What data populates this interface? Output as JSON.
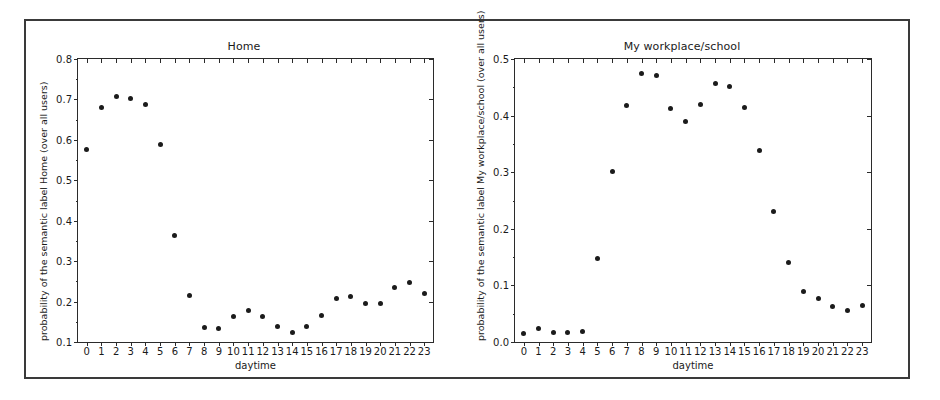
{
  "page": {
    "background_color": "#ffffff",
    "frame_color": "#3a3a3a",
    "marker_color": "#1b1b1b",
    "axis_color": "#2b2b2b"
  },
  "charts": [
    {
      "id": "home",
      "title": "Home",
      "xlabel": "daytime",
      "ylabel": "probability of the semantic label Home (over all users)",
      "xticks": [
        "0",
        "1",
        "2",
        "3",
        "4",
        "5",
        "6",
        "7",
        "8",
        "9",
        "10",
        "11",
        "12",
        "13",
        "14",
        "15",
        "16",
        "17",
        "18",
        "19",
        "20",
        "21",
        "22",
        "23"
      ],
      "yticks": [
        "0.1",
        "0.2",
        "0.3",
        "0.4",
        "0.5",
        "0.6",
        "0.7",
        "0.8"
      ]
    },
    {
      "id": "work",
      "title": "My workplace/school",
      "xlabel": "daytime",
      "ylabel": "probability of the semantic label My workplace/school (over all users)",
      "xticks": [
        "0",
        "1",
        "2",
        "3",
        "4",
        "5",
        "6",
        "7",
        "8",
        "9",
        "10",
        "11",
        "12",
        "13",
        "14",
        "15",
        "16",
        "17",
        "18",
        "19",
        "20",
        "21",
        "22",
        "23"
      ],
      "yticks": [
        "0.0",
        "0.1",
        "0.2",
        "0.3",
        "0.4",
        "0.5"
      ]
    }
  ],
  "chart_data": [
    {
      "type": "scatter",
      "id": "home",
      "title": "Home",
      "xlabel": "daytime",
      "ylabel": "probability of the semantic label Home (over all users)",
      "x": [
        0,
        1,
        2,
        3,
        4,
        5,
        6,
        7,
        8,
        9,
        10,
        11,
        12,
        13,
        14,
        15,
        16,
        17,
        18,
        19,
        20,
        21,
        22,
        23
      ],
      "values": [
        0.575,
        0.68,
        0.707,
        0.703,
        0.687,
        0.588,
        0.364,
        0.215,
        0.137,
        0.134,
        0.162,
        0.179,
        0.162,
        0.139,
        0.124,
        0.139,
        0.165,
        0.208,
        0.212,
        0.196,
        0.195,
        0.235,
        0.248,
        0.221
      ],
      "xlim": [
        -0.6,
        23.6
      ],
      "ylim": [
        0.1,
        0.8
      ],
      "yticks": [
        0.1,
        0.2,
        0.3,
        0.4,
        0.5,
        0.6,
        0.7,
        0.8
      ],
      "xticks": [
        0,
        1,
        2,
        3,
        4,
        5,
        6,
        7,
        8,
        9,
        10,
        11,
        12,
        13,
        14,
        15,
        16,
        17,
        18,
        19,
        20,
        21,
        22,
        23
      ],
      "grid": false,
      "legend": null,
      "marker": "circle",
      "marker_color": "#1b1b1b"
    },
    {
      "type": "scatter",
      "id": "work",
      "title": "My workplace/school",
      "xlabel": "daytime",
      "ylabel": "probability of the semantic label My workplace/school (over all users)",
      "x": [
        0,
        1,
        2,
        3,
        4,
        5,
        6,
        7,
        8,
        9,
        10,
        11,
        12,
        13,
        14,
        15,
        16,
        17,
        18,
        19,
        20,
        21,
        22,
        23
      ],
      "values": [
        0.015,
        0.023,
        0.017,
        0.016,
        0.019,
        0.147,
        0.301,
        0.417,
        0.474,
        0.47,
        0.412,
        0.389,
        0.419,
        0.457,
        0.452,
        0.414,
        0.339,
        0.231,
        0.141,
        0.089,
        0.076,
        0.062,
        0.056,
        0.065
      ],
      "xlim": [
        -0.6,
        23.6
      ],
      "ylim": [
        0.0,
        0.5
      ],
      "yticks": [
        0.0,
        0.1,
        0.2,
        0.3,
        0.4,
        0.5
      ],
      "xticks": [
        0,
        1,
        2,
        3,
        4,
        5,
        6,
        7,
        8,
        9,
        10,
        11,
        12,
        13,
        14,
        15,
        16,
        17,
        18,
        19,
        20,
        21,
        22,
        23
      ],
      "grid": false,
      "legend": null,
      "marker": "circle",
      "marker_color": "#1b1b1b"
    }
  ]
}
